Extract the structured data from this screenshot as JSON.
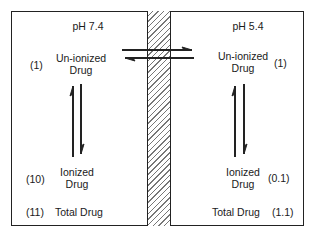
{
  "diagram": {
    "type": "membrane-partition",
    "left_compartment": {
      "ph_label": "pH 7.4",
      "unionized": {
        "label_line1": "Un-ionized",
        "label_line2": "Drug",
        "value": "(1)"
      },
      "ionized": {
        "label_line1": "Ionized",
        "label_line2": "Drug",
        "value": "(10)"
      },
      "total": {
        "label": "Total Drug",
        "value": "(11)"
      }
    },
    "right_compartment": {
      "ph_label": "pH 5.4",
      "unionized": {
        "label_line1": "Un-ionized",
        "label_line2": "Drug",
        "value": "(1)"
      },
      "ionized": {
        "label_line1": "Ionized",
        "label_line2": "Drug",
        "value": "(0.1)"
      },
      "total": {
        "label": "Total Drug",
        "value": "(1.1)"
      }
    },
    "membrane": {
      "style": "hatched"
    },
    "arrows": [
      {
        "name": "transmembrane-forward",
        "direction": "right"
      },
      {
        "name": "transmembrane-reverse",
        "direction": "left"
      },
      {
        "name": "left-ionization-up",
        "direction": "up"
      },
      {
        "name": "left-ionization-down",
        "direction": "down"
      },
      {
        "name": "right-ionization-up",
        "direction": "up"
      },
      {
        "name": "right-ionization-down",
        "direction": "down"
      }
    ],
    "colors": {
      "line": "#222222",
      "background": "#ffffff",
      "hatch": "#777777"
    }
  }
}
